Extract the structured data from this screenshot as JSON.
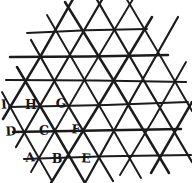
{
  "figure": {
    "background_color": "#ffffff",
    "ink_color": "#1b1b1b",
    "labels": [
      {
        "text": "I",
        "x": 4,
        "y": 104
      },
      {
        "text": "H",
        "x": 31,
        "y": 104
      },
      {
        "text": "G",
        "x": 61,
        "y": 103
      },
      {
        "text": "D",
        "x": 11,
        "y": 131
      },
      {
        "text": "C",
        "x": 44,
        "y": 130
      },
      {
        "text": "F",
        "x": 76,
        "y": 129
      },
      {
        "text": "A",
        "x": 30,
        "y": 157
      },
      {
        "text": "B",
        "x": 57,
        "y": 158
      },
      {
        "text": "E",
        "x": 86,
        "y": 158
      }
    ],
    "lines": {
      "horizontal": [
        [
          27,
          33,
          147,
          29
        ],
        [
          10,
          57,
          168,
          55
        ],
        [
          6,
          80,
          186,
          82
        ],
        [
          9,
          107,
          188,
          102
        ],
        [
          13,
          132,
          181,
          129
        ],
        [
          24,
          159,
          191,
          155
        ]
      ],
      "diagonal_down": [
        [
          2,
          92,
          52,
          181
        ],
        [
          17,
          67,
          85,
          183
        ],
        [
          31,
          40,
          113,
          181
        ],
        [
          47,
          15,
          141,
          178
        ],
        [
          65,
          2,
          169,
          173
        ],
        [
          96,
          -2,
          192,
          162
        ],
        [
          126,
          -2,
          192,
          111
        ]
      ],
      "diagonal_up": [
        [
          3,
          119,
          73,
          -1
        ],
        [
          16,
          147,
          103,
          -2
        ],
        [
          31,
          172,
          133,
          -1
        ],
        [
          51,
          183,
          152,
          17
        ],
        [
          85,
          183,
          178,
          17
        ],
        [
          120,
          175,
          186,
          62
        ],
        [
          151,
          173,
          192,
          102
        ]
      ]
    }
  }
}
